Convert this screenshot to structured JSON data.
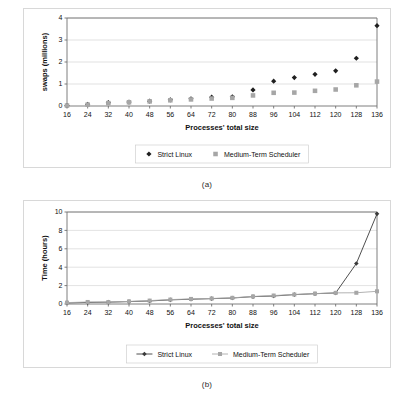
{
  "figures": [
    {
      "id": "figure-a",
      "caption": "(a)",
      "chart_data": {
        "type": "scatter",
        "title": "",
        "xlabel": "Processes' total size",
        "ylabel": "swaps (millions)",
        "categories": [
          16,
          24,
          32,
          40,
          48,
          56,
          64,
          72,
          80,
          88,
          96,
          104,
          112,
          120,
          128,
          136
        ],
        "x": [
          16,
          24,
          32,
          40,
          48,
          56,
          64,
          72,
          80,
          88,
          96,
          104,
          112,
          120,
          128,
          136
        ],
        "xlim": [
          16,
          136
        ],
        "ylim": [
          0,
          4
        ],
        "yticks": [
          0,
          1,
          2,
          3,
          4
        ],
        "grid": true,
        "legend_position": "bottom",
        "series": [
          {
            "name": "Strict Linux",
            "marker": "diamond",
            "color": "#1f1f1f",
            "values": [
              0.02,
              0.07,
              0.15,
              0.18,
              0.22,
              0.28,
              0.33,
              0.4,
              0.42,
              0.73,
              1.13,
              1.29,
              1.44,
              1.6,
              2.17,
              3.65
            ]
          },
          {
            "name": "Medium-Term Scheduler",
            "marker": "square",
            "color": "#a6a6a6",
            "values": [
              0.02,
              0.06,
              0.13,
              0.17,
              0.21,
              0.26,
              0.3,
              0.34,
              0.37,
              0.48,
              0.6,
              0.61,
              0.69,
              0.75,
              0.94,
              1.11
            ]
          }
        ]
      }
    },
    {
      "id": "figure-b",
      "caption": "(b)",
      "chart_data": {
        "type": "line",
        "title": "",
        "xlabel": "Processes' total size",
        "ylabel": "Time (hours)",
        "categories": [
          16,
          24,
          32,
          40,
          48,
          56,
          64,
          72,
          80,
          88,
          96,
          104,
          112,
          120,
          128,
          136
        ],
        "x": [
          16,
          24,
          32,
          40,
          48,
          56,
          64,
          72,
          80,
          88,
          96,
          104,
          112,
          120,
          128,
          136
        ],
        "xlim": [
          16,
          136
        ],
        "ylim": [
          0,
          10
        ],
        "yticks": [
          0,
          2,
          4,
          6,
          8,
          10
        ],
        "grid": true,
        "legend_position": "bottom",
        "series": [
          {
            "name": "Strict Linux",
            "marker": "diamond",
            "color": "#3b3b3b",
            "values": [
              0.12,
              0.17,
              0.2,
              0.26,
              0.33,
              0.45,
              0.52,
              0.58,
              0.65,
              0.8,
              0.87,
              1.02,
              1.12,
              1.2,
              4.4,
              9.8
            ]
          },
          {
            "name": "Medium-Term Scheduler",
            "marker": "square",
            "color": "#a6a6a6",
            "values": [
              0.15,
              0.22,
              0.21,
              0.28,
              0.37,
              0.48,
              0.55,
              0.6,
              0.67,
              0.82,
              0.92,
              1.03,
              1.13,
              1.21,
              1.22,
              1.38
            ]
          }
        ]
      }
    }
  ]
}
